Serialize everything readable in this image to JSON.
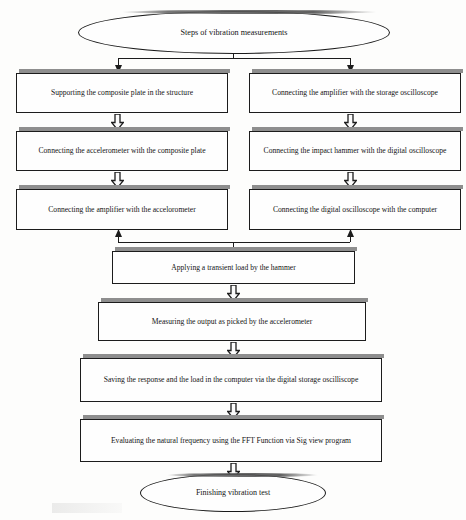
{
  "diagram": {
    "type": "flowchart",
    "title_node": "Steps  of vibration measurements",
    "end_node": "Finishing vibration test",
    "orientation": "top-to-bottom, two parallel branches merging",
    "colors": {
      "node_border": "#1c1c1c",
      "node_fill": "#fefefe",
      "shadow": "#8e8e8e",
      "page_background": "#fdfdfc"
    },
    "start": {
      "shape": "ellipse",
      "label": "Steps  of vibration measurements"
    },
    "left_branch": [
      {
        "shape": "rect",
        "label": "Supporting the composite plate in the structure"
      },
      {
        "shape": "rect",
        "label": "Connecting the accelerometer with the composite plate"
      },
      {
        "shape": "rect",
        "label": "Connecting the amplifier with the accelorometer"
      }
    ],
    "right_branch": [
      {
        "shape": "rect",
        "label": "Connecting the amplifier with the storage oscilloscope"
      },
      {
        "shape": "rect",
        "label": "Connecting the impact hammer with the digital oscilloscope"
      },
      {
        "shape": "rect",
        "label": "Connecting the digital oscilloscope with the computer"
      }
    ],
    "merged_steps": [
      {
        "shape": "rect",
        "label": "Applying a transient load by the hammer"
      },
      {
        "shape": "rect",
        "label": "Measuring the output as picked by the accelerometer"
      },
      {
        "shape": "rect",
        "label": "Saving the response and the load in the computer via the digital storage oscilliscope"
      },
      {
        "shape": "rect",
        "label": "Evaluating the natural frequency using the FFT Function via  Sig view program"
      }
    ],
    "end": {
      "shape": "ellipse",
      "label": "Finishing vibration test"
    },
    "connectors": {
      "split_icon": "branch-split-connector",
      "merge_icon": "branch-merge-connector",
      "arrow_icon": "block-arrow-down-icon",
      "thin_arrow_down_icon": "thin-arrow-down-icon",
      "thin_arrow_up_icon": "thin-arrow-up-icon"
    }
  }
}
